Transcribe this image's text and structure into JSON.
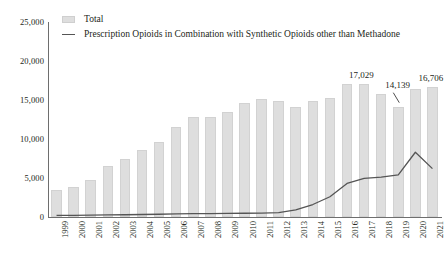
{
  "chart_data": {
    "type": "bar",
    "title": "",
    "xlabel": "",
    "ylabel": "",
    "ylim": [
      0,
      25000
    ],
    "grid": false,
    "legend_position": "top-left",
    "categories": [
      "1999",
      "2000",
      "2001",
      "2002",
      "2003",
      "2004",
      "2005",
      "2006",
      "2007",
      "2008",
      "2009",
      "2010",
      "2011",
      "2012",
      "2013",
      "2014",
      "2015",
      "2016",
      "2017",
      "2018",
      "2019",
      "2020",
      "2021"
    ],
    "ytick_labels": [
      "0",
      "5,000",
      "10,000",
      "15,000",
      "20,000",
      "25,000"
    ],
    "ytick_values": [
      0,
      5000,
      10000,
      15000,
      20000,
      25000
    ],
    "series": [
      {
        "name": "Total",
        "type": "bar",
        "color": "#dedede",
        "values": [
          3442,
          3785,
          4770,
          6483,
          7460,
          8577,
          9612,
          11589,
          12796,
          12872,
          13523,
          14583,
          15140,
          14915,
          14145,
          14838,
          15281,
          17087,
          17029,
          15773,
          14139,
          16416,
          16706
        ]
      },
      {
        "name": "Prescription Opioids in Combination with Synthetic Opioids other than Methadone",
        "type": "line",
        "color": "#555555",
        "values": [
          200,
          210,
          230,
          260,
          290,
          320,
          350,
          400,
          420,
          440,
          460,
          480,
          500,
          560,
          900,
          1600,
          2600,
          4300,
          4950,
          5100,
          5400,
          8300,
          6200
        ]
      }
    ],
    "point_labels": [
      {
        "category": "2017",
        "value": 17029,
        "text": "17,029"
      },
      {
        "category": "2019",
        "value": 14139,
        "text": "14,139"
      },
      {
        "category": "2021",
        "value": 16706,
        "text": "16,706"
      }
    ]
  }
}
